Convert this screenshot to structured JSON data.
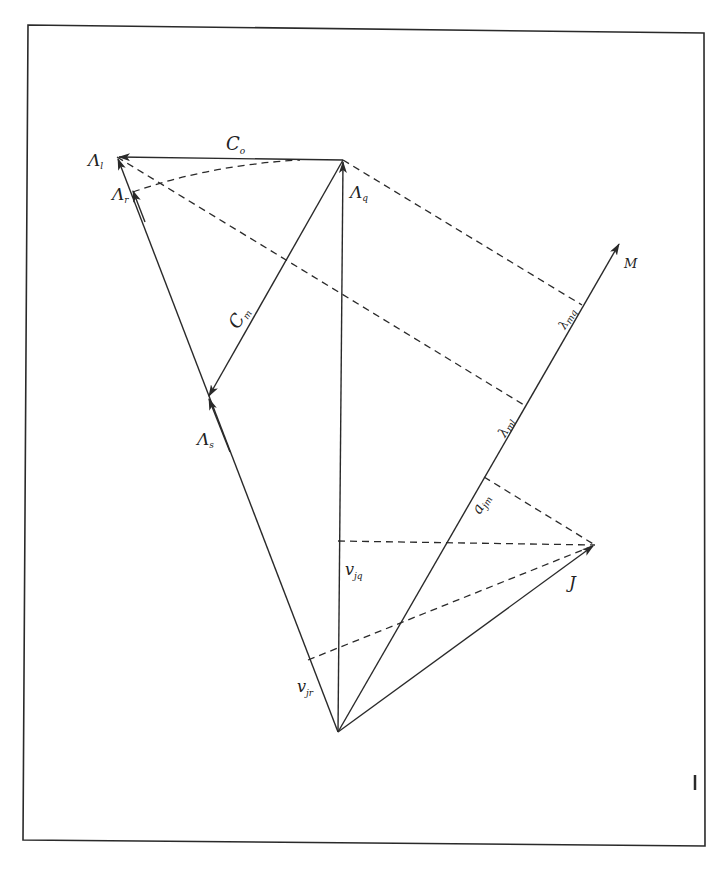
{
  "diagram": {
    "type": "vector-diagram",
    "colors": {
      "line": "#2a2a2a",
      "background": "#ffffff"
    },
    "points": {
      "lambda_l": [
        117,
        157
      ],
      "lambda_q_top": [
        343,
        160
      ],
      "origin": [
        338,
        732
      ],
      "lambda_s_tip": [
        208,
        397
      ],
      "lambda_r": [
        133,
        190
      ],
      "M_tip": [
        620,
        242
      ],
      "J": [
        595,
        545
      ],
      "lambda_mq_foot": [
        582,
        305
      ],
      "lambda_ml_foot": [
        524,
        405
      ],
      "ajm_foot": [
        484,
        477
      ],
      "vjq_foot": [
        338,
        541
      ],
      "vjr_foot": [
        308,
        660
      ]
    },
    "labels": {
      "C0": {
        "main": "C",
        "sub": "o"
      },
      "Lambda_l": {
        "main": "Λ",
        "sub": "l"
      },
      "Lambda_r": {
        "main": "Λ",
        "sub": "r"
      },
      "Lambda_q": {
        "main": "Λ",
        "sub": "q"
      },
      "Cm": {
        "main": "C",
        "sub": "m"
      },
      "Lambda_s": {
        "main": "Λ",
        "sub": "s"
      },
      "M": {
        "main": "M"
      },
      "lambda_mq": {
        "main": "λ",
        "sub": "mq"
      },
      "lambda_ml": {
        "main": "λ",
        "sub": "ml"
      },
      "a_jm": {
        "main": "a",
        "sub": "jm"
      },
      "J": {
        "main": "J"
      },
      "v_jq": {
        "main": "v",
        "sub": "jq"
      },
      "v_jr": {
        "main": "v",
        "sub": "jr"
      }
    }
  }
}
